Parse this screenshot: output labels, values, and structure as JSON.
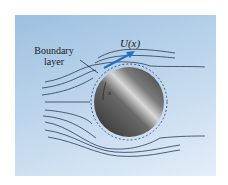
{
  "figure": {
    "velocity_label": "U(x)",
    "boundary_label_line1": "Boundary",
    "boundary_label_line2": "layer",
    "x_coordinate_label": "x",
    "colors": {
      "background_top": "#9cc0e0",
      "background_bottom": "#e4eef8",
      "streamline": "#2b3a55",
      "velocity_arrow": "#1f6fc4",
      "cylinder_dark": "#3a3a3a",
      "cylinder_light": "#d8d8d8"
    }
  }
}
